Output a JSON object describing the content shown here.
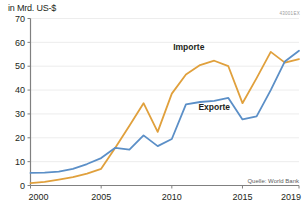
{
  "header": {
    "axis_unit_title": "in Mrd. US-$",
    "chart_code": "43001EX"
  },
  "footer": {
    "source": "Quelle: World Bank"
  },
  "colors": {
    "importe": "#e0a03c",
    "exporte": "#5b8fc7",
    "axis": "#808080",
    "grid": "#e8e8e8",
    "text": "#231f20"
  },
  "chart_data": {
    "type": "line",
    "title": "in Mrd. US-$",
    "xlabel": "",
    "ylabel": "in Mrd. US-$",
    "xlim": [
      2000,
      2019
    ],
    "ylim": [
      0,
      70
    ],
    "ytick_labels": [
      "0",
      "10",
      "20",
      "30",
      "40",
      "50",
      "60",
      "70"
    ],
    "yticks": [
      0,
      10,
      20,
      30,
      40,
      50,
      60,
      70
    ],
    "xtick_labels": [
      "2000",
      "2005",
      "2010",
      "2015",
      "2019"
    ],
    "xticks": [
      2000,
      2005,
      2010,
      2015,
      2019
    ],
    "grid": true,
    "legend": "inline-annotations",
    "x": [
      2000,
      2001,
      2002,
      2003,
      2004,
      2005,
      2006,
      2007,
      2008,
      2009,
      2010,
      2011,
      2012,
      2013,
      2014,
      2015,
      2016,
      2017,
      2018,
      2019
    ],
    "series": [
      {
        "name": "Importe",
        "color": "#e0a03c",
        "values": [
          1.0,
          1.5,
          2.5,
          3.5,
          5.0,
          7.0,
          15.8,
          25.0,
          34.5,
          22.5,
          38.5,
          46.5,
          50.5,
          52.3,
          50.0,
          34.5,
          45.0,
          56.0,
          51.5,
          53.0
        ]
      },
      {
        "name": "Exporte",
        "color": "#5b8fc7",
        "values": [
          5.3,
          5.4,
          5.8,
          7.0,
          9.0,
          11.5,
          15.8,
          15.0,
          21.0,
          16.5,
          19.5,
          34.0,
          35.0,
          35.5,
          36.7,
          27.7,
          29.0,
          40.0,
          52.0,
          56.5
        ]
      }
    ],
    "annotations": [
      {
        "text": "Importe",
        "x": 2011.2,
        "y": 57.0
      },
      {
        "text": "Exporte",
        "x": 2013.0,
        "y": 31.5
      }
    ]
  }
}
